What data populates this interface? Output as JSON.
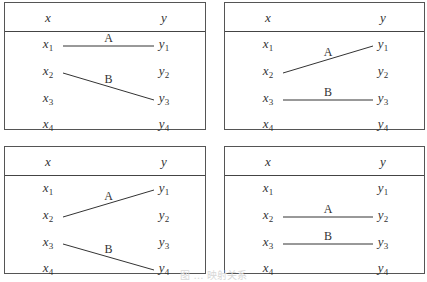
{
  "caption": "图 … 映射关系",
  "header": {
    "x": "x",
    "y": "y"
  },
  "rows": {
    "x": [
      {
        "base": "x",
        "sub": "1"
      },
      {
        "base": "x",
        "sub": "2"
      },
      {
        "base": "x",
        "sub": "3"
      },
      {
        "base": "x",
        "sub": "4"
      }
    ],
    "y": [
      {
        "base": "y",
        "sub": "1"
      },
      {
        "base": "y",
        "sub": "2"
      },
      {
        "base": "y",
        "sub": "3"
      },
      {
        "base": "y",
        "sub": "4"
      }
    ]
  },
  "panels": [
    {
      "id": "top-left",
      "mappings": [
        {
          "label": "A",
          "from": 1,
          "to": 1
        },
        {
          "label": "B",
          "from": 2,
          "to": 3
        }
      ]
    },
    {
      "id": "top-right",
      "mappings": [
        {
          "label": "A",
          "from": 2,
          "to": 1
        },
        {
          "label": "B",
          "from": 3,
          "to": 3
        }
      ]
    },
    {
      "id": "bottom-left",
      "mappings": [
        {
          "label": "A",
          "from": 2,
          "to": 1
        },
        {
          "label": "B",
          "from": 3,
          "to": 4
        }
      ]
    },
    {
      "id": "bottom-right",
      "mappings": [
        {
          "label": "A",
          "from": 2,
          "to": 2
        },
        {
          "label": "B",
          "from": 3,
          "to": 3
        }
      ]
    }
  ]
}
